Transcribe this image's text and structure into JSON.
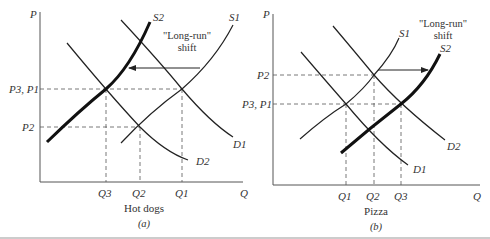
{
  "panels": [
    {
      "id": "a",
      "caption": "(a)",
      "good": "Hot dogs",
      "y_axis": "P",
      "x_axis": "Q",
      "price_labels": {
        "high": "P3, P1",
        "low": "P2"
      },
      "quantity_labels": [
        "Q3",
        "Q2",
        "Q1"
      ],
      "curves": {
        "s1": "S1",
        "s2": "S2",
        "d1": "D1",
        "d2": "D2"
      },
      "annotation": {
        "line1": "\"Long-run\"",
        "line2": "shift"
      }
    },
    {
      "id": "b",
      "caption": "(b)",
      "good": "Pizza",
      "y_axis": "P",
      "x_axis": "Q",
      "price_labels": {
        "high": "P2",
        "low": "P3, P1"
      },
      "quantity_labels": [
        "Q1",
        "Q2",
        "Q3"
      ],
      "curves": {
        "s1": "S1",
        "s2": "S2",
        "d1": "D1",
        "d2": "D2"
      },
      "annotation": {
        "line1": "\"Long-run\"",
        "line2": "shift"
      }
    }
  ],
  "colors": {
    "line": "#222222",
    "dash": "#555555",
    "text": "#333333",
    "rule": "#999999"
  }
}
